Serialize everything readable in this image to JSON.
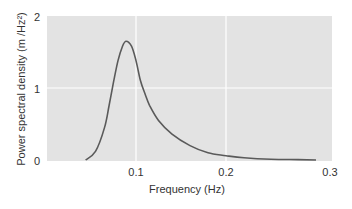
{
  "chart_data": {
    "type": "line",
    "title": "",
    "xlabel": "Frequency (Hz)",
    "ylabel": "Power spectral density  (m /Hz²)",
    "xlim": [
      0,
      0.3
    ],
    "ylim": [
      0,
      2
    ],
    "x_ticks": [
      "0.1",
      "0.2",
      "0.3"
    ],
    "y_ticks": [
      "0",
      "1",
      "2"
    ],
    "grid": true,
    "legend": null,
    "series": [
      {
        "name": "spectrum",
        "x": [
          0.044,
          0.055,
          0.065,
          0.07,
          0.075,
          0.08,
          0.085,
          0.089,
          0.095,
          0.1,
          0.105,
          0.11,
          0.115,
          0.125,
          0.14,
          0.16,
          0.18,
          0.2,
          0.22,
          0.25,
          0.28,
          0.3
        ],
        "values": [
          0.0,
          0.12,
          0.45,
          0.75,
          1.08,
          1.38,
          1.58,
          1.65,
          1.58,
          1.38,
          1.1,
          0.92,
          0.76,
          0.55,
          0.36,
          0.2,
          0.1,
          0.06,
          0.03,
          0.01,
          0.005,
          0.0
        ]
      }
    ],
    "colors": {
      "plot_bg": "#e3e3e3",
      "grid": "#ffffff",
      "line": "#5a5a5a"
    }
  },
  "axes": {
    "xlabel": "Frequency (Hz)",
    "ylabel": "Power spectral density  (m /Hz²)",
    "x_tick_labels": [
      "0.1",
      "0.2",
      "0.3"
    ],
    "y_tick_labels": [
      "0",
      "1",
      "2"
    ]
  }
}
